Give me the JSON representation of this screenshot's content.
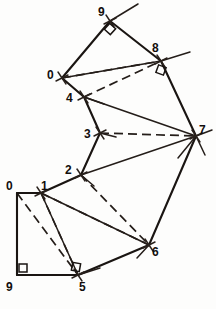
{
  "figure": {
    "type": "survey-traverse-diagram",
    "width": 216,
    "height": 309,
    "background_color": "#fdfdfc",
    "ink_color": "#1a1512"
  },
  "stations": [
    {
      "id": "n9top",
      "label": "9",
      "x": 110,
      "y": 21,
      "label_x": 98,
      "label_y": 6,
      "tick": true,
      "right_angle": true
    },
    {
      "id": "n8",
      "label": "8",
      "x": 161,
      "y": 61,
      "label_x": 152,
      "label_y": 42,
      "tick": true,
      "right_angle": true
    },
    {
      "id": "n0top",
      "label": "0",
      "x": 62,
      "y": 78,
      "label_x": 47,
      "label_y": 69,
      "tick": true,
      "right_angle": false
    },
    {
      "id": "n4",
      "label": "4",
      "x": 84,
      "y": 97,
      "label_x": 66,
      "label_y": 92,
      "tick": true,
      "right_angle": false
    },
    {
      "id": "n3",
      "label": "3",
      "x": 100,
      "y": 133,
      "label_x": 84,
      "label_y": 128,
      "tick": true,
      "right_angle": false
    },
    {
      "id": "n7",
      "label": "7",
      "x": 196,
      "y": 136,
      "label_x": 199,
      "label_y": 124,
      "tick": true,
      "right_angle": false
    },
    {
      "id": "n2",
      "label": "2",
      "x": 81,
      "y": 175,
      "label_x": 65,
      "label_y": 164,
      "tick": true,
      "right_angle": false
    },
    {
      "id": "n1",
      "label": "1",
      "x": 41,
      "y": 193,
      "label_x": 41,
      "label_y": 180,
      "tick": true,
      "right_angle": false
    },
    {
      "id": "n0bot",
      "label": "0",
      "x": 17,
      "y": 193,
      "label_x": 6,
      "label_y": 180,
      "tick": false,
      "right_angle": false
    },
    {
      "id": "n6",
      "label": "6",
      "x": 149,
      "y": 245,
      "label_x": 152,
      "label_y": 246,
      "tick": true,
      "right_angle": false
    },
    {
      "id": "n5",
      "label": "5",
      "x": 78,
      "y": 275,
      "label_x": 79,
      "label_y": 281,
      "tick": true,
      "right_angle": true
    },
    {
      "id": "n9bot",
      "label": "9",
      "x": 17,
      "y": 275,
      "label_x": 6,
      "label_y": 281,
      "tick": false,
      "right_angle": true
    }
  ],
  "solid_edges": [
    {
      "name": "edge-0top-9top",
      "from": "n0top",
      "to": "n9top"
    },
    {
      "name": "edge-9top-8",
      "from": "n9top",
      "to": "n8"
    },
    {
      "name": "edge-8-7",
      "from": "n8",
      "to": "n7"
    },
    {
      "name": "edge-0top-4",
      "from": "n0top",
      "to": "n4"
    },
    {
      "name": "edge-4-3",
      "from": "n4",
      "to": "n3"
    },
    {
      "name": "edge-3-2",
      "from": "n3",
      "to": "n2"
    },
    {
      "name": "edge-2-1",
      "from": "n2",
      "to": "n1"
    },
    {
      "name": "edge-1-0bot",
      "from": "n1",
      "to": "n0bot"
    },
    {
      "name": "edge-0bot-9bot",
      "from": "n0bot",
      "to": "n9bot"
    },
    {
      "name": "edge-9bot-5",
      "from": "n9bot",
      "to": "n5"
    },
    {
      "name": "edge-5-6",
      "from": "n5",
      "to": "n6"
    },
    {
      "name": "edge-6-7",
      "from": "n6",
      "to": "n7"
    },
    {
      "name": "tie-0top-8-solid",
      "from": "n0top",
      "to": "n8"
    },
    {
      "name": "tie-4-7-solid",
      "from": "n4",
      "to": "n7"
    },
    {
      "name": "tie-1-6-solid",
      "from": "n1",
      "to": "n6"
    },
    {
      "name": "tie-1-5-solid",
      "from": "n1",
      "to": "n5"
    },
    {
      "name": "tie-2-7-solid",
      "from": "n2",
      "to": "n7"
    }
  ],
  "dashed_edges": [
    {
      "name": "tie-0top-8-dashed",
      "from": "n0top",
      "to": "n8"
    },
    {
      "name": "tie-4-8-dashed",
      "from": "n4",
      "to": "n8"
    },
    {
      "name": "tie-3-7-dashed",
      "from": "n3",
      "to": "n7"
    },
    {
      "name": "tie-2-6-dashed",
      "from": "n2",
      "to": "n6"
    },
    {
      "name": "tie-1-6-dashed",
      "from": "n1",
      "to": "n6"
    },
    {
      "name": "tie-0bot-5-dashed",
      "from": "n0bot",
      "to": "n5"
    },
    {
      "name": "tie-1-5-dashed",
      "from": "n1",
      "to": "n5"
    }
  ],
  "overshoot_rays": [
    {
      "name": "ray-past-9top",
      "x1": 110,
      "y1": 21,
      "x2": 138,
      "y2": 4
    },
    {
      "name": "ray-past-8",
      "x1": 161,
      "y1": 61,
      "x2": 190,
      "y2": 52
    },
    {
      "name": "ray-past-7a",
      "x1": 196,
      "y1": 136,
      "x2": 212,
      "y2": 130
    },
    {
      "name": "ray-past-7b",
      "x1": 196,
      "y1": 136,
      "x2": 205,
      "y2": 155
    },
    {
      "name": "ray-past-7c",
      "x1": 196,
      "y1": 136,
      "x2": 178,
      "y2": 158
    },
    {
      "name": "ray-past-6",
      "x1": 149,
      "y1": 245,
      "x2": 137,
      "y2": 258
    },
    {
      "name": "ray-past-5",
      "x1": 78,
      "y1": 275,
      "x2": 100,
      "y2": 268
    },
    {
      "name": "ray-past-2",
      "x1": 81,
      "y1": 175,
      "x2": 94,
      "y2": 186
    },
    {
      "name": "ray-past-3",
      "x1": 100,
      "y1": 133,
      "x2": 116,
      "y2": 137
    },
    {
      "name": "ray-past-4",
      "x1": 84,
      "y1": 97,
      "x2": 104,
      "y2": 104
    }
  ],
  "accessibility": {
    "alt_text": "Closed polygon traverse diagram with twelve labelled survey stations connected by solid boundary lines and dashed interior tie lines."
  }
}
